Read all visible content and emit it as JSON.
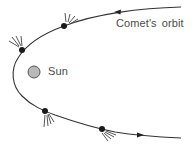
{
  "labels": {
    "orbit": "Comet's orbit",
    "sun": "Sun"
  },
  "colors": {
    "orbit_line": "#333333",
    "comet": "#1a1a1a",
    "sun_fill": "#b8b8b8",
    "sun_stroke": "#555555",
    "tail": "#444444",
    "text": "#4a4a4a",
    "background": "#ffffff"
  },
  "objects": {
    "sun": {
      "cx": 34,
      "cy": 72,
      "r": 6
    },
    "comets": [
      {
        "id": "comet-1",
        "cx": 64,
        "cy": 26,
        "tail_direction": "up-right"
      },
      {
        "id": "comet-2",
        "cx": 22,
        "cy": 50,
        "tail_direction": "up-left"
      },
      {
        "id": "comet-3",
        "cx": 45,
        "cy": 111,
        "tail_direction": "down"
      },
      {
        "id": "comet-4",
        "cx": 102,
        "cy": 129,
        "tail_direction": "down-right"
      }
    ],
    "arrows": [
      {
        "id": "arrow-incoming",
        "x": 118,
        "y": 13,
        "direction": "left"
      },
      {
        "id": "arrow-outgoing",
        "x": 140,
        "y": 136,
        "direction": "right"
      }
    ]
  }
}
